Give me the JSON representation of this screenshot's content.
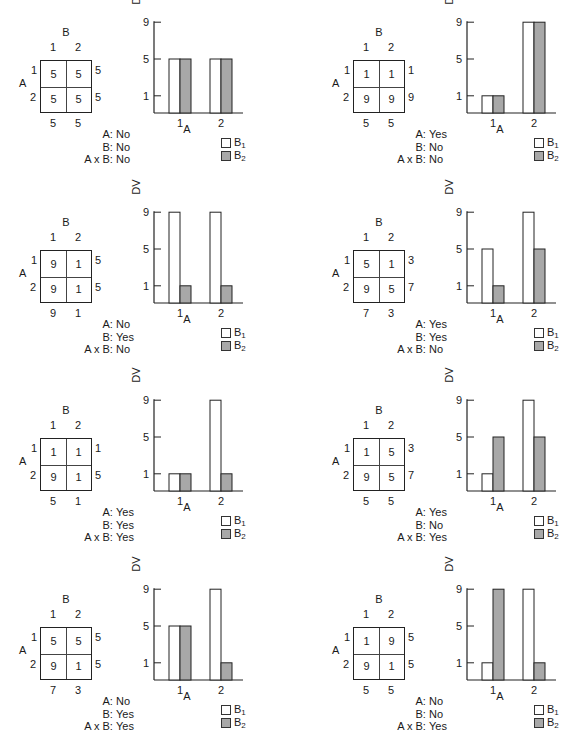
{
  "colors": {
    "b1_fill": "#ffffff",
    "b2_fill": "#a8a8a8",
    "stroke": "#222222"
  },
  "labels": {
    "factor_a": "A",
    "factor_b": "B",
    "level_1": "1",
    "level_2": "2",
    "y_axis": "DV",
    "legend_b1": "B",
    "legend_b1_sub": "1",
    "legend_b2": "B",
    "legend_b2_sub": "2",
    "sig_a": "A:",
    "sig_b": "B:",
    "sig_ab": "A x B:"
  },
  "panels": [
    {
      "cells": [
        [
          "5",
          "5"
        ],
        [
          "5",
          "5"
        ]
      ],
      "row_means": [
        "5",
        "5"
      ],
      "col_means": [
        "5",
        "5"
      ],
      "sig": {
        "A": "No",
        "B": "No",
        "AxB": "No"
      }
    },
    {
      "cells": [
        [
          "1",
          "1"
        ],
        [
          "9",
          "9"
        ]
      ],
      "row_means": [
        "1",
        "9"
      ],
      "col_means": [
        "5",
        "5"
      ],
      "sig": {
        "A": "Yes",
        "B": "No",
        "AxB": "No"
      }
    },
    {
      "cells": [
        [
          "9",
          "1"
        ],
        [
          "9",
          "1"
        ]
      ],
      "row_means": [
        "5",
        "5"
      ],
      "col_means": [
        "9",
        "1"
      ],
      "sig": {
        "A": "No",
        "B": "Yes",
        "AxB": "No"
      }
    },
    {
      "cells": [
        [
          "5",
          "1"
        ],
        [
          "9",
          "5"
        ]
      ],
      "row_means": [
        "3",
        "7"
      ],
      "col_means": [
        "7",
        "3"
      ],
      "sig": {
        "A": "Yes",
        "B": "Yes",
        "AxB": "No"
      }
    },
    {
      "cells": [
        [
          "1",
          "1"
        ],
        [
          "9",
          "1"
        ]
      ],
      "row_means": [
        "1",
        "5"
      ],
      "col_means": [
        "5",
        "1"
      ],
      "sig": {
        "A": "Yes",
        "B": "Yes",
        "AxB": "Yes"
      }
    },
    {
      "cells": [
        [
          "1",
          "5"
        ],
        [
          "9",
          "5"
        ]
      ],
      "row_means": [
        "3",
        "7"
      ],
      "col_means": [
        "5",
        "5"
      ],
      "sig": {
        "A": "Yes",
        "B": "No",
        "AxB": "Yes"
      }
    },
    {
      "cells": [
        [
          "5",
          "5"
        ],
        [
          "9",
          "1"
        ]
      ],
      "row_means": [
        "5",
        "5"
      ],
      "col_means": [
        "7",
        "3"
      ],
      "sig": {
        "A": "No",
        "B": "Yes",
        "AxB": "Yes"
      }
    },
    {
      "cells": [
        [
          "1",
          "9"
        ],
        [
          "9",
          "1"
        ]
      ],
      "row_means": [
        "5",
        "5"
      ],
      "col_means": [
        "5",
        "5"
      ],
      "sig": {
        "A": "No",
        "B": "No",
        "AxB": "Yes"
      }
    }
  ],
  "chart_data": [
    {
      "type": "bar",
      "title": "",
      "xlabel": "A",
      "ylabel": "DV",
      "categories": [
        "1",
        "2"
      ],
      "yticks": [
        1,
        5,
        9
      ],
      "ylim": [
        0,
        9
      ],
      "legend_position": "bottom-right",
      "grid": false,
      "series": [
        {
          "name": "B1",
          "values": [
            5,
            5
          ]
        },
        {
          "name": "B2",
          "values": [
            5,
            5
          ]
        }
      ],
      "significance": {
        "A": "No",
        "B": "No",
        "A x B": "No"
      }
    },
    {
      "type": "bar",
      "title": "",
      "xlabel": "A",
      "ylabel": "DV",
      "categories": [
        "1",
        "2"
      ],
      "yticks": [
        1,
        5,
        9
      ],
      "ylim": [
        0,
        9
      ],
      "legend_position": "bottom-right",
      "grid": false,
      "series": [
        {
          "name": "B1",
          "values": [
            1,
            9
          ]
        },
        {
          "name": "B2",
          "values": [
            1,
            9
          ]
        }
      ],
      "significance": {
        "A": "Yes",
        "B": "No",
        "A x B": "No"
      }
    },
    {
      "type": "bar",
      "title": "",
      "xlabel": "A",
      "ylabel": "DV",
      "categories": [
        "1",
        "2"
      ],
      "yticks": [
        1,
        5,
        9
      ],
      "ylim": [
        0,
        9
      ],
      "legend_position": "bottom-right",
      "grid": false,
      "series": [
        {
          "name": "B1",
          "values": [
            9,
            9
          ]
        },
        {
          "name": "B2",
          "values": [
            1,
            1
          ]
        }
      ],
      "significance": {
        "A": "No",
        "B": "Yes",
        "A x B": "No"
      }
    },
    {
      "type": "bar",
      "title": "",
      "xlabel": "A",
      "ylabel": "DV",
      "categories": [
        "1",
        "2"
      ],
      "yticks": [
        1,
        5,
        9
      ],
      "ylim": [
        0,
        9
      ],
      "legend_position": "bottom-right",
      "grid": false,
      "series": [
        {
          "name": "B1",
          "values": [
            5,
            9
          ]
        },
        {
          "name": "B2",
          "values": [
            1,
            5
          ]
        }
      ],
      "significance": {
        "A": "Yes",
        "B": "Yes",
        "A x B": "No"
      }
    },
    {
      "type": "bar",
      "title": "",
      "xlabel": "A",
      "ylabel": "DV",
      "categories": [
        "1",
        "2"
      ],
      "yticks": [
        1,
        5,
        9
      ],
      "ylim": [
        0,
        9
      ],
      "legend_position": "bottom-right",
      "grid": false,
      "series": [
        {
          "name": "B1",
          "values": [
            1,
            9
          ]
        },
        {
          "name": "B2",
          "values": [
            1,
            1
          ]
        }
      ],
      "significance": {
        "A": "Yes",
        "B": "Yes",
        "A x B": "Yes"
      }
    },
    {
      "type": "bar",
      "title": "",
      "xlabel": "A",
      "ylabel": "DV",
      "categories": [
        "1",
        "2"
      ],
      "yticks": [
        1,
        5,
        9
      ],
      "ylim": [
        0,
        9
      ],
      "legend_position": "bottom-right",
      "grid": false,
      "series": [
        {
          "name": "B1",
          "values": [
            1,
            9
          ]
        },
        {
          "name": "B2",
          "values": [
            5,
            5
          ]
        }
      ],
      "significance": {
        "A": "Yes",
        "B": "No",
        "A x B": "Yes"
      }
    },
    {
      "type": "bar",
      "title": "",
      "xlabel": "A",
      "ylabel": "DV",
      "categories": [
        "1",
        "2"
      ],
      "yticks": [
        1,
        5,
        9
      ],
      "ylim": [
        0,
        9
      ],
      "legend_position": "bottom-right",
      "grid": false,
      "series": [
        {
          "name": "B1",
          "values": [
            5,
            9
          ]
        },
        {
          "name": "B2",
          "values": [
            5,
            1
          ]
        }
      ],
      "significance": {
        "A": "No",
        "B": "Yes",
        "A x B": "Yes"
      }
    },
    {
      "type": "bar",
      "title": "",
      "xlabel": "A",
      "ylabel": "DV",
      "categories": [
        "1",
        "2"
      ],
      "yticks": [
        1,
        5,
        9
      ],
      "ylim": [
        0,
        9
      ],
      "legend_position": "bottom-right",
      "grid": false,
      "series": [
        {
          "name": "B1",
          "values": [
            1,
            9
          ]
        },
        {
          "name": "B2",
          "values": [
            9,
            1
          ]
        }
      ],
      "significance": {
        "A": "No",
        "B": "No",
        "A x B": "Yes"
      }
    }
  ]
}
